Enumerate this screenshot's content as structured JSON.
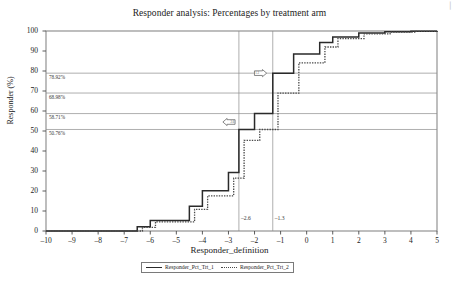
{
  "chart_data": {
    "type": "line",
    "subtype": "step",
    "title": "Responder analysis: Percentages by treatment arm",
    "xlabel": "Responder_definition",
    "ylabel": "Responder (%)",
    "xlim": [
      -10,
      5
    ],
    "ylim": [
      0,
      100
    ],
    "xticks": [
      -10,
      -9,
      -8,
      -7,
      -6,
      -5,
      -4,
      -3,
      -2,
      -1,
      0,
      1,
      2,
      3,
      4,
      5
    ],
    "xtick_labels": [
      "–10",
      "–9",
      "–8",
      "–7",
      "–6",
      "–5",
      "–4",
      "–3",
      "–2",
      "–1",
      "0",
      "1",
      "2",
      "3",
      "4",
      "5"
    ],
    "yticks": [
      0,
      10,
      20,
      30,
      40,
      50,
      60,
      70,
      80,
      90,
      100
    ],
    "ytick_labels": [
      "0",
      "10",
      "20",
      "30",
      "40",
      "50",
      "60",
      "70",
      "80",
      "90",
      "100"
    ],
    "grid": "horizontal-reference-lines-only",
    "legend_position": "bottom-center",
    "series": [
      {
        "name": "Responder_Pct_Trt_1",
        "style": "solid",
        "color": "#2a2a2a",
        "x": [
          -10,
          -7,
          -6.5,
          -6,
          -5,
          -4.5,
          -4,
          -3.5,
          -3,
          -2.6,
          -2,
          -1.6,
          -1.3,
          -1,
          -0.5,
          0,
          0.5,
          1,
          2,
          3,
          4,
          5
        ],
        "y": [
          0,
          0,
          2.1,
          5.2,
          5.2,
          12.4,
          20.1,
          20.1,
          29.3,
          50.76,
          58.71,
          58.71,
          78.92,
          78.92,
          88.5,
          88.5,
          94.2,
          97.0,
          99.0,
          99.6,
          99.9,
          100
        ]
      },
      {
        "name": "Responder_Pct_Trt_2",
        "style": "dashed",
        "color": "#4a4a4a",
        "x": [
          -10,
          -6.8,
          -6.3,
          -5.8,
          -4.8,
          -4.3,
          -3.8,
          -3.3,
          -2.8,
          -2.4,
          -1.8,
          -1.4,
          -1.1,
          -0.8,
          -0.3,
          0.2,
          0.7,
          1.2,
          2.2,
          3.2,
          4.2,
          5
        ],
        "y": [
          0,
          0,
          1.8,
          4.6,
          4.6,
          10.8,
          17.6,
          17.6,
          26.4,
          45.3,
          50.76,
          50.76,
          68.98,
          68.98,
          84.1,
          84.1,
          92.0,
          96.2,
          98.6,
          99.4,
          99.8,
          100
        ]
      }
    ],
    "reference_lines_y": [
      {
        "value": 78.92,
        "label": "78.92%"
      },
      {
        "value": 68.98,
        "label": "68.98%"
      },
      {
        "value": 58.71,
        "label": "58.71%"
      },
      {
        "value": 50.76,
        "label": "50.76%"
      }
    ],
    "reference_lines_x": [
      {
        "value": -2.6,
        "label": "–2.6"
      },
      {
        "value": -1.3,
        "label": "–1.3"
      }
    ],
    "annotations": [
      {
        "name": "right-arrow-marker",
        "direction": "right",
        "x": -1.85,
        "y": 78.92,
        "text": "1.3"
      },
      {
        "name": "left-arrow-marker",
        "direction": "left",
        "x": -2.9,
        "y": 54.5,
        "text": "2.6"
      }
    ]
  },
  "legend": {
    "items": [
      {
        "label": "Responder_Pct_Trt_1",
        "style": "solid"
      },
      {
        "label": "Responder_Pct_Trt_2",
        "style": "dashed"
      }
    ]
  },
  "corner": {
    "mark": "▏"
  }
}
